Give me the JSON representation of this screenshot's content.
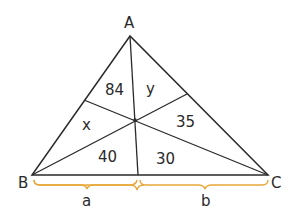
{
  "diagram": {
    "title": "",
    "vertices": [
      {
        "id": "A",
        "label": "A"
      },
      {
        "id": "B",
        "label": "B"
      },
      {
        "id": "C",
        "label": "C"
      }
    ],
    "regions": [
      {
        "label": "84"
      },
      {
        "label": "y"
      },
      {
        "label": "x"
      },
      {
        "label": "35"
      },
      {
        "label": "40"
      },
      {
        "label": "30"
      }
    ],
    "segments": [
      {
        "label": "a"
      },
      {
        "label": "b"
      }
    ],
    "colors": {
      "line": "#2a2a2a",
      "brace": "#e8a83a"
    }
  }
}
